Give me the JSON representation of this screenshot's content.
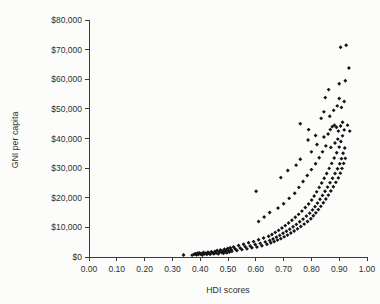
{
  "chart_data": {
    "type": "scatter",
    "title": "",
    "xlabel": "HDI scores",
    "ylabel": "GNI per capita",
    "xlim": [
      0.0,
      1.0
    ],
    "ylim": [
      0,
      80000
    ],
    "xticks": [
      0.0,
      0.1,
      0.2,
      0.3,
      0.4,
      0.5,
      0.6,
      0.7,
      0.8,
      0.9,
      1.0
    ],
    "xtick_labels": [
      "0.00",
      "0.10",
      "0.20",
      "0.30",
      "0.40",
      "0.50",
      "0.60",
      "0.70",
      "0.80",
      "0.90",
      "1.00"
    ],
    "yticks": [
      0,
      10000,
      20000,
      30000,
      40000,
      50000,
      60000,
      70000,
      80000
    ],
    "ytick_labels": [
      "$0",
      "$10,000",
      "$20,000",
      "$30,000",
      "$40,000",
      "$50,000",
      "$60,000",
      "$70,000",
      "$80,000"
    ],
    "grid": false,
    "legend": false,
    "marker": "diamond",
    "marker_color": "#141414",
    "series": [
      {
        "name": "Countries",
        "points": [
          [
            0.34,
            700
          ],
          [
            0.371,
            620
          ],
          [
            0.378,
            900
          ],
          [
            0.382,
            1100
          ],
          [
            0.386,
            760
          ],
          [
            0.39,
            1250
          ],
          [
            0.393,
            820
          ],
          [
            0.397,
            1400
          ],
          [
            0.401,
            980
          ],
          [
            0.404,
            1150
          ],
          [
            0.408,
            700
          ],
          [
            0.412,
            1500
          ],
          [
            0.416,
            1050
          ],
          [
            0.42,
            1300
          ],
          [
            0.424,
            880
          ],
          [
            0.428,
            1600
          ],
          [
            0.432,
            1200
          ],
          [
            0.436,
            950
          ],
          [
            0.44,
            1750
          ],
          [
            0.444,
            1400
          ],
          [
            0.449,
            1100
          ],
          [
            0.453,
            1900
          ],
          [
            0.457,
            1350
          ],
          [
            0.461,
            2200
          ],
          [
            0.465,
            1050
          ],
          [
            0.469,
            1700
          ],
          [
            0.473,
            2400
          ],
          [
            0.477,
            1500
          ],
          [
            0.481,
            2000
          ],
          [
            0.484,
            1250
          ],
          [
            0.487,
            2600
          ],
          [
            0.49,
            1800
          ],
          [
            0.493,
            2300
          ],
          [
            0.496,
            1400
          ],
          [
            0.499,
            2900
          ],
          [
            0.502,
            2100
          ],
          [
            0.505,
            1650
          ],
          [
            0.508,
            3100
          ],
          [
            0.511,
            2500
          ],
          [
            0.514,
            1900
          ],
          [
            0.52,
            3400
          ],
          [
            0.526,
            2700
          ],
          [
            0.532,
            2200
          ],
          [
            0.538,
            3900
          ],
          [
            0.544,
            3000
          ],
          [
            0.55,
            2500
          ],
          [
            0.556,
            4300
          ],
          [
            0.562,
            3500
          ],
          [
            0.568,
            2800
          ],
          [
            0.574,
            4800
          ],
          [
            0.58,
            3700
          ],
          [
            0.586,
            3100
          ],
          [
            0.592,
            5200
          ],
          [
            0.598,
            4200
          ],
          [
            0.601,
            22200
          ],
          [
            0.604,
            3400
          ],
          [
            0.61,
            5800
          ],
          [
            0.616,
            4600
          ],
          [
            0.622,
            3800
          ],
          [
            0.628,
            6400
          ],
          [
            0.634,
            5100
          ],
          [
            0.64,
            4300
          ],
          [
            0.646,
            7000
          ],
          [
            0.65,
            5600
          ],
          [
            0.654,
            4800
          ],
          [
            0.658,
            7600
          ],
          [
            0.662,
            6100
          ],
          [
            0.666,
            5200
          ],
          [
            0.67,
            8300
          ],
          [
            0.674,
            6700
          ],
          [
            0.678,
            5700
          ],
          [
            0.682,
            9000
          ],
          [
            0.686,
            7300
          ],
          [
            0.69,
            6200
          ],
          [
            0.694,
            9800
          ],
          [
            0.698,
            8000
          ],
          [
            0.702,
            6800
          ],
          [
            0.706,
            10600
          ],
          [
            0.71,
            8700
          ],
          [
            0.714,
            7400
          ],
          [
            0.718,
            11500
          ],
          [
            0.722,
            9400
          ],
          [
            0.726,
            8100
          ],
          [
            0.73,
            12400
          ],
          [
            0.734,
            10200
          ],
          [
            0.738,
            8800
          ],
          [
            0.742,
            13400
          ],
          [
            0.746,
            11000
          ],
          [
            0.75,
            9500
          ],
          [
            0.754,
            14400
          ],
          [
            0.758,
            11900
          ],
          [
            0.762,
            10300
          ],
          [
            0.766,
            15500
          ],
          [
            0.77,
            12800
          ],
          [
            0.774,
            11100
          ],
          [
            0.778,
            16700
          ],
          [
            0.782,
            13800
          ],
          [
            0.786,
            12000
          ],
          [
            0.79,
            17900
          ],
          [
            0.794,
            14800
          ],
          [
            0.798,
            12900
          ],
          [
            0.801,
            19200
          ],
          [
            0.804,
            15900
          ],
          [
            0.807,
            13900
          ],
          [
            0.81,
            20600
          ],
          [
            0.813,
            17000
          ],
          [
            0.816,
            14900
          ],
          [
            0.819,
            22000
          ],
          [
            0.822,
            18200
          ],
          [
            0.825,
            16000
          ],
          [
            0.828,
            23500
          ],
          [
            0.831,
            19500
          ],
          [
            0.834,
            17100
          ],
          [
            0.837,
            25000
          ],
          [
            0.84,
            20800
          ],
          [
            0.843,
            18300
          ],
          [
            0.846,
            26600
          ],
          [
            0.849,
            22200
          ],
          [
            0.852,
            19600
          ],
          [
            0.855,
            28200
          ],
          [
            0.858,
            23600
          ],
          [
            0.861,
            20900
          ],
          [
            0.864,
            29900
          ],
          [
            0.867,
            25100
          ],
          [
            0.87,
            22300
          ],
          [
            0.873,
            31600
          ],
          [
            0.876,
            26600
          ],
          [
            0.879,
            23700
          ],
          [
            0.882,
            33400
          ],
          [
            0.885,
            28200
          ],
          [
            0.888,
            25200
          ],
          [
            0.891,
            35200
          ],
          [
            0.894,
            29800
          ],
          [
            0.897,
            26700
          ],
          [
            0.9,
            37100
          ],
          [
            0.902,
            31500
          ],
          [
            0.904,
            28300
          ],
          [
            0.906,
            39000
          ],
          [
            0.908,
            33200
          ],
          [
            0.91,
            29900
          ],
          [
            0.912,
            40900
          ],
          [
            0.914,
            35000
          ],
          [
            0.916,
            31600
          ],
          [
            0.918,
            42900
          ],
          [
            0.92,
            36800
          ],
          [
            0.922,
            33300
          ],
          [
            0.61,
            12000
          ],
          [
            0.63,
            13500
          ],
          [
            0.65,
            15000
          ],
          [
            0.68,
            16500
          ],
          [
            0.7,
            18000
          ],
          [
            0.72,
            19800
          ],
          [
            0.74,
            21500
          ],
          [
            0.755,
            23500
          ],
          [
            0.77,
            25500
          ],
          [
            0.785,
            27500
          ],
          [
            0.8,
            29500
          ],
          [
            0.815,
            31500
          ],
          [
            0.828,
            33500
          ],
          [
            0.84,
            35500
          ],
          [
            0.852,
            37500
          ],
          [
            0.69,
            26800
          ],
          [
            0.715,
            29200
          ],
          [
            0.745,
            31000
          ],
          [
            0.76,
            33000
          ],
          [
            0.8,
            35500
          ],
          [
            0.82,
            38000
          ],
          [
            0.845,
            40500
          ],
          [
            0.86,
            41500
          ],
          [
            0.868,
            43000
          ],
          [
            0.875,
            44000
          ],
          [
            0.883,
            44500
          ],
          [
            0.89,
            43800
          ],
          [
            0.897,
            42500
          ],
          [
            0.905,
            44200
          ],
          [
            0.912,
            45500
          ],
          [
            0.866,
            47500
          ],
          [
            0.88,
            49500
          ],
          [
            0.893,
            51000
          ],
          [
            0.9,
            53500
          ],
          [
            0.908,
            50500
          ],
          [
            0.918,
            52500
          ],
          [
            0.85,
            53800
          ],
          [
            0.862,
            56500
          ],
          [
            0.9,
            58500
          ],
          [
            0.922,
            59500
          ],
          [
            0.935,
            63800
          ],
          [
            0.905,
            70800
          ],
          [
            0.925,
            71500
          ],
          [
            0.76,
            45000
          ],
          [
            0.79,
            43000
          ],
          [
            0.835,
            46800
          ],
          [
            0.845,
            49000
          ],
          [
            0.815,
            41000
          ],
          [
            0.788,
            39500
          ],
          [
            0.87,
            37000
          ],
          [
            0.885,
            38500
          ],
          [
            0.895,
            39800
          ],
          [
            0.93,
            44500
          ],
          [
            0.938,
            42500
          ]
        ]
      }
    ]
  },
  "axis": {
    "xlabel": "HDI scores",
    "ylabel": "GNI per capita"
  }
}
